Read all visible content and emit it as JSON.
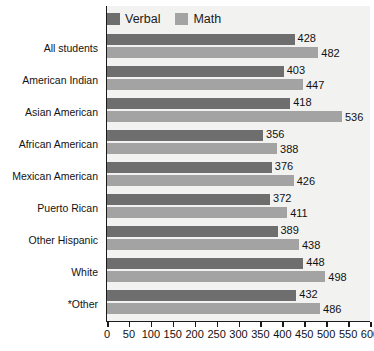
{
  "chart_data": {
    "type": "bar",
    "orientation": "horizontal",
    "title": "",
    "xlabel": "",
    "ylabel": "",
    "xlim": [
      0,
      600
    ],
    "xticks": [
      0,
      50,
      100,
      150,
      200,
      250,
      300,
      350,
      400,
      450,
      500,
      550,
      600
    ],
    "grid": false,
    "legend_position": "top-left",
    "categories": [
      "All students",
      "American Indian",
      "Asian American",
      "African American",
      "Mexican American",
      "Puerto Rican",
      "Other Hispanic",
      "White",
      "*Other"
    ],
    "series": [
      {
        "name": "Verbal",
        "color": "#6e6e6e",
        "values": [
          428,
          403,
          418,
          356,
          376,
          372,
          389,
          448,
          432
        ]
      },
      {
        "name": "Math",
        "color": "#a3a3a3",
        "values": [
          482,
          447,
          536,
          388,
          426,
          411,
          438,
          498,
          486
        ]
      }
    ]
  },
  "legend": {
    "items": [
      {
        "label": "Verbal",
        "swatch": "verbal"
      },
      {
        "label": "Math",
        "swatch": "math"
      }
    ]
  },
  "colors": {
    "verbal": "#6e6e6e",
    "math": "#a3a3a3",
    "axis": "#1a1a1a",
    "plot_background": "#f2f2f1",
    "page_background": "#ffffff",
    "text": "#111111"
  }
}
